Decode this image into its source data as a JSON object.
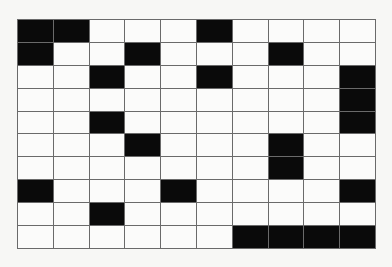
{
  "grid": {
    "rows": 10,
    "cols": 10,
    "colors": {
      "filled": "#0a0a0a",
      "empty": "#fbfbfa",
      "line": "#6a6a6a"
    },
    "cells": [
      [
        1,
        1,
        0,
        0,
        0,
        1,
        0,
        0,
        0,
        0
      ],
      [
        1,
        0,
        0,
        1,
        0,
        0,
        0,
        1,
        0,
        0
      ],
      [
        0,
        0,
        1,
        0,
        0,
        1,
        0,
        0,
        0,
        1
      ],
      [
        0,
        0,
        0,
        0,
        0,
        0,
        0,
        0,
        0,
        1
      ],
      [
        0,
        0,
        1,
        0,
        0,
        0,
        0,
        0,
        0,
        1
      ],
      [
        0,
        0,
        0,
        1,
        0,
        0,
        0,
        1,
        0,
        0
      ],
      [
        0,
        0,
        0,
        0,
        0,
        0,
        0,
        1,
        0,
        0
      ],
      [
        1,
        0,
        0,
        0,
        1,
        0,
        0,
        0,
        0,
        1
      ],
      [
        0,
        0,
        1,
        0,
        0,
        0,
        0,
        0,
        0,
        0
      ],
      [
        0,
        0,
        0,
        0,
        0,
        0,
        1,
        1,
        1,
        1
      ]
    ]
  }
}
